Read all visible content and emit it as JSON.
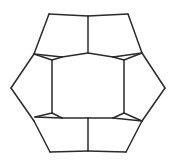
{
  "figure": {
    "background_color": "#ffffff",
    "stroke_color": "#2b2b2b",
    "stroke_width": 1.5,
    "fill_color": "#ffffff",
    "canvas": {
      "width": 176,
      "height": 167
    },
    "counts": {
      "hexagon_count": 1,
      "pentagon_count": 6,
      "total_faces": 7,
      "outer_boundary_sides": 12
    },
    "center_hexagon": {
      "name": "central-hexagon",
      "points": "62,57 113,57 124,60 124,113 113,118 62,118 52,113 52,60"
    },
    "outer_outline": {
      "name": "outer-boundary",
      "points": "88,16 128,14 142,53 165,88 142,121 126,152 88,151 50,152 34,121 11,88 34,54 49,14"
    },
    "pentagons": [
      {
        "name": "pentagon-top",
        "points": "88,16 128,14 142,53 113,57 88,53"
      },
      {
        "name": "pentagon-top-left",
        "points": "49,14 88,16 88,53 62,57 34,54"
      },
      {
        "name": "pentagon-left",
        "points": "34,54 52,60 52,113 35,117 11,88"
      },
      {
        "name": "pentagon-right",
        "points": "142,53 165,88 142,121 124,113 124,60"
      },
      {
        "name": "pentagon-bottom-left",
        "points": "35,117 52,113 62,118 88,118 88,151 50,152 34,121"
      },
      {
        "name": "pentagon-bottom-right",
        "points": "88,118 113,118 124,113 142,121 126,152 88,151"
      }
    ],
    "spokes": [
      {
        "name": "spoke-top",
        "path": "M 88,16 L 88,53"
      },
      {
        "name": "spoke-upper-left",
        "path": "M 34,54 L 62,57"
      },
      {
        "name": "spoke-upper-right",
        "path": "M 142,53 L 113,57"
      },
      {
        "name": "spoke-lower-left",
        "path": "M 35,117 L 62,118"
      },
      {
        "name": "spoke-lower-right",
        "path": "M 142,121 L 113,118"
      },
      {
        "name": "spoke-bottom",
        "path": "M 88,118 L 88,151"
      }
    ],
    "hexagon_edges": [
      {
        "name": "hex-edge-top-left",
        "path": "M 62,57 L 88,53"
      },
      {
        "name": "hex-edge-top-right",
        "path": "M 88,53 L 113,57"
      },
      {
        "name": "hex-edge-right-upper",
        "path": "M 113,57 L 124,60"
      },
      {
        "name": "hex-edge-right",
        "path": "M 124,60 L 124,113"
      },
      {
        "name": "hex-edge-right-lower",
        "path": "M 124,113 L 113,118"
      },
      {
        "name": "hex-edge-bottom-right",
        "path": "M 113,118 L 88,118"
      },
      {
        "name": "hex-edge-bottom-left",
        "path": "M 88,118 L 62,118"
      },
      {
        "name": "hex-edge-left-lower",
        "path": "M 62,118 L 52,113"
      },
      {
        "name": "hex-edge-left",
        "path": "M 52,113 L 52,60"
      },
      {
        "name": "hex-edge-left-upper",
        "path": "M 52,60 L 62,57"
      }
    ],
    "outer_edges": [
      {
        "name": "outer-edge-top-left",
        "path": "M 49,14 L 88,16"
      },
      {
        "name": "outer-edge-top-right",
        "path": "M 88,16 L 128,14"
      },
      {
        "name": "outer-edge-upper-right",
        "path": "M 128,14 L 142,53"
      },
      {
        "name": "outer-edge-right-upper",
        "path": "M 142,53 L 165,88"
      },
      {
        "name": "outer-edge-right-lower",
        "path": "M 165,88 L 142,121"
      },
      {
        "name": "outer-edge-lower-right",
        "path": "M 142,121 L 126,152"
      },
      {
        "name": "outer-edge-bottom-right",
        "path": "M 126,152 L 88,151"
      },
      {
        "name": "outer-edge-bottom-left",
        "path": "M 88,151 L 50,152"
      },
      {
        "name": "outer-edge-lower-left",
        "path": "M 50,152 L 34,121"
      },
      {
        "name": "outer-edge-left-lower",
        "path": "M 34,121 L 11,88"
      },
      {
        "name": "outer-edge-left-upper",
        "path": "M 11,88 L 34,54"
      },
      {
        "name": "outer-edge-upper-left",
        "path": "M 34,54 L 49,14"
      }
    ],
    "outer_spur_edges": [
      {
        "name": "spur-left-upper",
        "path": "M 34,54 L 52,60"
      },
      {
        "name": "spur-left-lower",
        "path": "M 35,117 L 52,113"
      },
      {
        "name": "spur-right-upper",
        "path": "M 142,53 L 124,60"
      },
      {
        "name": "spur-right-lower",
        "path": "M 142,121 L 124,113"
      }
    ]
  }
}
